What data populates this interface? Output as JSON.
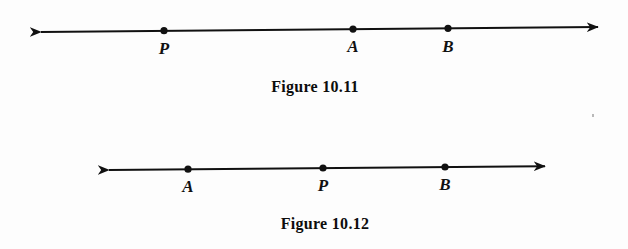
{
  "page": {
    "width": 628,
    "height": 249,
    "background_color": "#fdfdfd",
    "ink_color": "#111111"
  },
  "figures": [
    {
      "id": "figure-10-11",
      "caption": "Figure 10.11",
      "caption_center_x": 315,
      "caption_y": 80,
      "line": {
        "x1": 30,
        "y1": 32,
        "x2": 609,
        "y2": 27,
        "left_arrow": true,
        "right_arrow": true,
        "stroke_width": 2
      },
      "points": [
        {
          "label": "P",
          "x": 164,
          "y": 30,
          "label_y": 36
        },
        {
          "label": "A",
          "x": 353,
          "y": 28,
          "label_y": 34
        },
        {
          "label": "B",
          "x": 448,
          "y": 28,
          "label_y": 34
        }
      ],
      "order": "P, A, B"
    },
    {
      "id": "figure-10-12",
      "caption": "Figure 10.12",
      "caption_center_x": 325,
      "caption_y": 217,
      "line": {
        "x1": 98,
        "y1": 170,
        "x2": 556,
        "y2": 166,
        "left_arrow": true,
        "right_arrow": true,
        "stroke_width": 2
      },
      "points": [
        {
          "label": "A",
          "x": 188,
          "y": 169,
          "label_y": 175
        },
        {
          "label": "P",
          "x": 323,
          "y": 168,
          "label_y": 174
        },
        {
          "label": "B",
          "x": 445,
          "y": 167,
          "label_y": 173
        }
      ],
      "order": "A, P, B"
    }
  ],
  "artifacts": [
    {
      "name": "scan-speck",
      "x": 592,
      "y": 114
    }
  ]
}
